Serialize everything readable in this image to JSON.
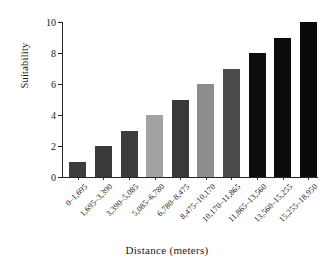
{
  "chart_data": {
    "type": "bar",
    "title": "",
    "xlabel": "Distance  (meters)",
    "ylabel": "Suitability",
    "categories": [
      "0–1,695",
      "1,695–3,390",
      "3,390–5,085",
      "5,085–6,780",
      "6,780–8,475",
      "8,475–10,170",
      "10,170–11,865",
      "11,865–13,560",
      "13,560–15,255",
      "15,255–18,950"
    ],
    "values": [
      1,
      2,
      3,
      4,
      5,
      6,
      7,
      8,
      9,
      10
    ],
    "bar_colors": [
      "#3d3d3d",
      "#3a3a3a",
      "#3c3c3c",
      "#a2a2a2",
      "#393939",
      "#8d8d8d",
      "#4b4b4b",
      "#0d0d0d",
      "#0b0b0b",
      "#0a0a0a"
    ],
    "ylim": [
      0,
      10
    ],
    "yticks": [
      0,
      2,
      4,
      6,
      8,
      10
    ],
    "ytick_labels": [
      "0",
      "2",
      "4",
      "6",
      "8",
      "10"
    ],
    "grid": false,
    "legend": false,
    "axis_color": "#262626",
    "background": "#ffffff"
  }
}
